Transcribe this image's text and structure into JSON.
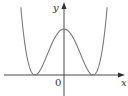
{
  "chart_data": {
    "type": "line",
    "title": "",
    "xlabel": "x",
    "ylabel": "y",
    "origin_label": "0",
    "grid": false,
    "legend": null,
    "series": [
      {
        "name": "f(x)",
        "x": [
          -1.55,
          -1.3,
          -1.0,
          -0.6,
          0.0,
          0.6,
          1.0,
          1.3,
          1.55
        ],
        "y": [
          2.0,
          0.47,
          0.0,
          0.41,
          1.0,
          0.41,
          0.0,
          0.47,
          2.0
        ]
      }
    ],
    "features": {
      "local_max": {
        "x": 0,
        "y": 1
      },
      "minima": [
        {
          "x": -1,
          "y": 0
        },
        {
          "x": 1,
          "y": 0
        }
      ]
    },
    "xticks": [],
    "yticks": [],
    "colors": {
      "curve": "#7a7a7a",
      "axes": "#333333"
    }
  },
  "labels": {
    "x_axis": "x",
    "y_axis": "y",
    "origin": "0"
  }
}
